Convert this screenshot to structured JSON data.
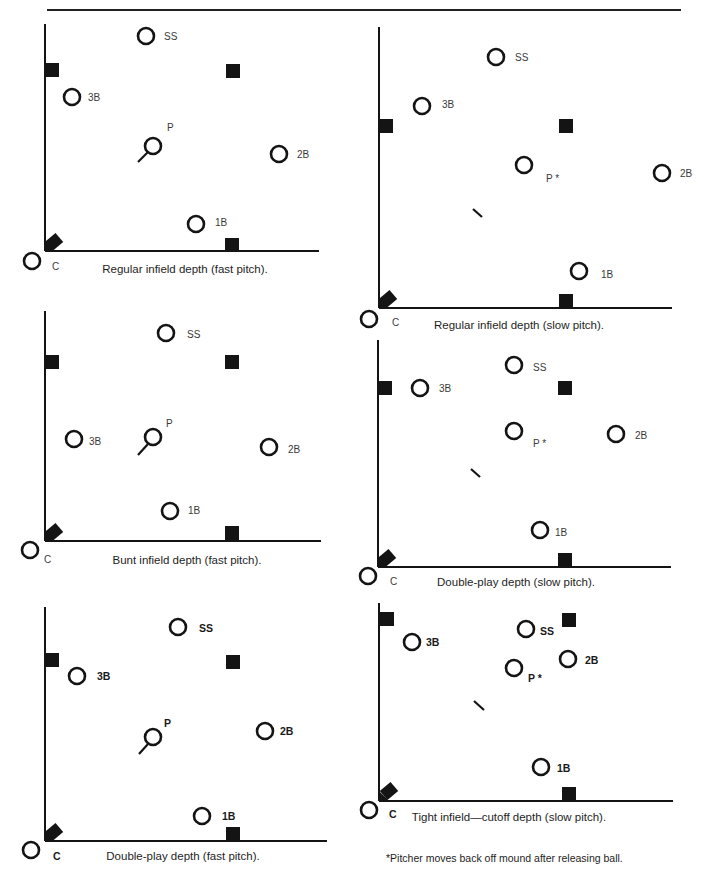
{
  "page": {
    "footnote": "*Pitcher moves back off mound after releasing ball."
  },
  "diagrams": [
    {
      "id": "regular-fast",
      "caption": "Regular infield depth (fast pitch).",
      "caption_pos": [
        185,
        273
      ],
      "axis": {
        "x": 45,
        "top": 24,
        "bottom": 251,
        "right": 319
      },
      "bases": [
        [
          52,
          70
        ],
        [
          233,
          71
        ],
        [
          232,
          245
        ]
      ],
      "home": [
        54,
        242
      ],
      "rubber": [
        [
          138,
          162
        ],
        [
          148,
          152
        ]
      ],
      "bold_labels": false,
      "players": [
        {
          "pos": "SS",
          "label": "SS",
          "c": [
            146,
            36
          ],
          "l": [
            164,
            40
          ]
        },
        {
          "pos": "3B",
          "label": "3B",
          "c": [
            72,
            97
          ],
          "l": [
            88,
            101
          ]
        },
        {
          "pos": "P",
          "label": "P",
          "c": [
            153,
            146
          ],
          "l": [
            167,
            131
          ]
        },
        {
          "pos": "2B",
          "label": "2B",
          "c": [
            279,
            154
          ],
          "l": [
            297,
            158
          ]
        },
        {
          "pos": "1B",
          "label": "1B",
          "c": [
            196,
            224
          ],
          "l": [
            215,
            226
          ]
        },
        {
          "pos": "C",
          "label": "C",
          "c": [
            32,
            261
          ],
          "l": [
            52,
            270
          ]
        }
      ]
    },
    {
      "id": "regular-slow",
      "caption": "Regular infield depth (slow pitch).",
      "caption_pos": [
        519,
        329
      ],
      "axis": {
        "x": 379,
        "top": 27,
        "bottom": 308,
        "right": 672
      },
      "bases": [
        [
          386,
          126
        ],
        [
          566,
          126
        ],
        [
          566,
          301
        ]
      ],
      "home": [
        388,
        299
      ],
      "rubber": [
        [
          473,
          209
        ],
        [
          482,
          217
        ]
      ],
      "bold_labels": false,
      "players": [
        {
          "pos": "SS",
          "label": "SS",
          "c": [
            496,
            57
          ],
          "l": [
            515,
            61
          ]
        },
        {
          "pos": "3B",
          "label": "3B",
          "c": [
            422,
            106
          ],
          "l": [
            442,
            108
          ]
        },
        {
          "pos": "P",
          "label": "P *",
          "c": [
            524,
            165
          ],
          "l": [
            546,
            182
          ]
        },
        {
          "pos": "2B",
          "label": "2B",
          "c": [
            662,
            173
          ],
          "l": [
            680,
            177
          ]
        },
        {
          "pos": "1B",
          "label": "1B",
          "c": [
            579,
            271
          ],
          "l": [
            601,
            278
          ]
        },
        {
          "pos": "C",
          "label": "C",
          "c": [
            369,
            319
          ],
          "l": [
            392,
            326
          ]
        }
      ]
    },
    {
      "id": "bunt-fast",
      "caption": "Bunt infield depth (fast pitch).",
      "caption_pos": [
        187,
        564
      ],
      "axis": {
        "x": 45,
        "top": 311,
        "bottom": 541,
        "right": 321
      },
      "bases": [
        [
          52,
          362
        ],
        [
          232,
          362
        ],
        [
          232,
          533
        ]
      ],
      "home": [
        54,
        532
      ],
      "rubber": [
        [
          138,
          455
        ],
        [
          148,
          444
        ]
      ],
      "bold_labels": false,
      "players": [
        {
          "pos": "SS",
          "label": "SS",
          "c": [
            166,
            333
          ],
          "l": [
            187,
            338
          ]
        },
        {
          "pos": "3B",
          "label": "3B",
          "c": [
            74,
            439
          ],
          "l": [
            89,
            445
          ]
        },
        {
          "pos": "P",
          "label": "P",
          "c": [
            153,
            437
          ],
          "l": [
            166,
            427
          ]
        },
        {
          "pos": "2B",
          "label": "2B",
          "c": [
            269,
            447
          ],
          "l": [
            288,
            453
          ]
        },
        {
          "pos": "1B",
          "label": "1B",
          "c": [
            170,
            511
          ],
          "l": [
            188,
            514
          ]
        },
        {
          "pos": "C",
          "label": "C",
          "c": [
            30,
            550
          ],
          "l": [
            44,
            563
          ]
        }
      ]
    },
    {
      "id": "doubleplay-slow",
      "caption": "Double-play depth (slow pitch).",
      "caption_pos": [
        516,
        586
      ],
      "axis": {
        "x": 378,
        "top": 340,
        "bottom": 567,
        "right": 671
      },
      "bases": [
        [
          385,
          388
        ],
        [
          565,
          388
        ],
        [
          565,
          560
        ]
      ],
      "home": [
        387,
        558
      ],
      "rubber": [
        [
          471,
          469
        ],
        [
          480,
          477
        ]
      ],
      "bold_labels": false,
      "players": [
        {
          "pos": "SS",
          "label": "SS",
          "c": [
            514,
            365
          ],
          "l": [
            533,
            371
          ]
        },
        {
          "pos": "3B",
          "label": "3B",
          "c": [
            420,
            388
          ],
          "l": [
            439,
            392
          ]
        },
        {
          "pos": "P",
          "label": "P *",
          "c": [
            514,
            431
          ],
          "l": [
            533,
            447
          ]
        },
        {
          "pos": "2B",
          "label": "2B",
          "c": [
            616,
            434
          ],
          "l": [
            635,
            439
          ]
        },
        {
          "pos": "1B",
          "label": "1B",
          "c": [
            540,
            530
          ],
          "l": [
            555,
            536
          ]
        },
        {
          "pos": "C",
          "label": "C",
          "c": [
            368,
            576
          ],
          "l": [
            390,
            585
          ]
        }
      ]
    },
    {
      "id": "doubleplay-fast",
      "caption": "Double-play depth (fast pitch).",
      "caption_pos": [
        183,
        860
      ],
      "axis": {
        "x": 45,
        "top": 607,
        "bottom": 841,
        "right": 327
      },
      "bases": [
        [
          52,
          660
        ],
        [
          233,
          662
        ],
        [
          233,
          834
        ]
      ],
      "home": [
        54,
        832
      ],
      "rubber": [
        [
          139,
          754
        ],
        [
          148,
          744
        ]
      ],
      "bold_labels": true,
      "players": [
        {
          "pos": "SS",
          "label": "SS",
          "c": [
            178,
            627
          ],
          "l": [
            199,
            632
          ]
        },
        {
          "pos": "3B",
          "label": "3B",
          "c": [
            77,
            676
          ],
          "l": [
            97,
            680
          ]
        },
        {
          "pos": "P",
          "label": "P",
          "c": [
            153,
            737
          ],
          "l": [
            164,
            727
          ]
        },
        {
          "pos": "2B",
          "label": "2B",
          "c": [
            265,
            731
          ],
          "l": [
            280,
            735
          ]
        },
        {
          "pos": "1B",
          "label": "1B",
          "c": [
            202,
            816
          ],
          "l": [
            222,
            820
          ]
        },
        {
          "pos": "C",
          "label": "C",
          "c": [
            31,
            850
          ],
          "l": [
            53,
            860
          ]
        }
      ]
    },
    {
      "id": "tight-cutoff-slow",
      "caption": "Tight infield—cutoff depth (slow pitch).",
      "caption_pos": [
        509,
        821
      ],
      "axis": {
        "x": 379,
        "top": 603,
        "bottom": 801,
        "right": 673
      },
      "bases": [
        [
          387,
          619
        ],
        [
          569,
          620
        ],
        [
          569,
          794
        ]
      ],
      "home": [
        389,
        791
      ],
      "rubber": [
        [
          474,
          701
        ],
        [
          484,
          710
        ]
      ],
      "bold_labels": true,
      "players": [
        {
          "pos": "SS",
          "label": "SS",
          "c": [
            526,
            629
          ],
          "l": [
            540,
            635
          ]
        },
        {
          "pos": "3B",
          "label": "3B",
          "c": [
            412,
            642
          ],
          "l": [
            426,
            646
          ]
        },
        {
          "pos": "P",
          "label": "P *",
          "c": [
            514,
            668
          ],
          "l": [
            528,
            682
          ]
        },
        {
          "pos": "2B",
          "label": "2B",
          "c": [
            568,
            659
          ],
          "l": [
            585,
            664
          ]
        },
        {
          "pos": "1B",
          "label": "1B",
          "c": [
            541,
            767
          ],
          "l": [
            557,
            772
          ]
        },
        {
          "pos": "C",
          "label": "C",
          "c": [
            369,
            810
          ],
          "l": [
            389,
            818
          ]
        }
      ]
    }
  ],
  "legend": {
    "circle": "player-position",
    "square": "base",
    "diamond": "home-plate",
    "slash": "pitcher-rubber"
  },
  "colors": {
    "ink": "#141414",
    "label": "#3a3a3a",
    "paper": "#ffffff"
  }
}
